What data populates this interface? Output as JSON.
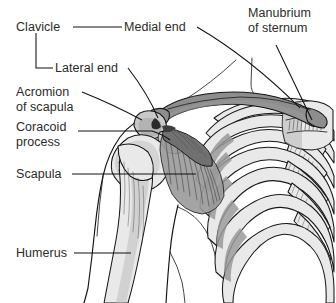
{
  "figure": {
    "view": "anterior right shoulder",
    "background_color": "#ffffff",
    "text_color": "#2b2b2b",
    "leader_color": "#101010",
    "width": 336,
    "height": 303
  },
  "labels": {
    "clavicle": "Clavicle",
    "medial_end": "Medial end",
    "manubrium_line1": "Manubrium",
    "manubrium_line2": "of sternum",
    "lateral_end": "Lateral end",
    "acromion_line1": "Acromion",
    "acromion_line2": "of scapula",
    "coracoid_line1": "Coracoid",
    "coracoid_line2": "process",
    "scapula": "Scapula",
    "humerus": "Humerus"
  },
  "structures": {
    "clavicle": {
      "name": "clavicle",
      "fill": "#8d8d8d"
    },
    "scapula": {
      "name": "scapula",
      "fill": "#9a9a9a"
    },
    "humerus": {
      "name": "humerus",
      "fill": "#d6d6d6"
    },
    "ribs": {
      "name": "rib-cage",
      "fill": "#e9e9e9"
    },
    "manubrium": {
      "name": "manubrium-of-sternum",
      "fill": "#e2e2e2"
    },
    "acromion": {
      "name": "acromion-process",
      "fill": "#c9c9c9"
    },
    "coracoid": {
      "name": "coracoid-process",
      "fill": "#bdbdbd"
    }
  }
}
